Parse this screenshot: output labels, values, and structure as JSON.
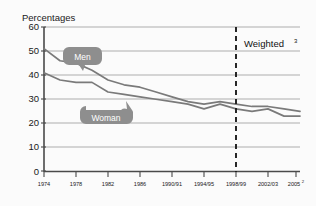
{
  "chart_data": {
    "type": "line",
    "title": "",
    "ylabel": "Percentages",
    "xlabel": "",
    "ylim": [
      0,
      60
    ],
    "ytick_values": [
      0,
      10,
      20,
      30,
      40,
      50,
      60
    ],
    "ytick_labels": [
      "0",
      "10",
      "20",
      "30",
      "40",
      "50",
      "60"
    ],
    "grid": true,
    "legend_position": "inline-callouts",
    "categories": [
      "1974",
      "1976",
      "1978",
      "1980",
      "1982",
      "1984",
      "1986",
      "1988",
      "1990/91",
      "1992/93",
      "1994/95",
      "1996/97",
      "1998/99",
      "2000/01",
      "2002/03",
      "2004/05",
      "2005"
    ],
    "xtick_labels": [
      "1974",
      "1978",
      "1982",
      "1986",
      "1990/91",
      "1994/95",
      "1998/99",
      "2002/03",
      "2005"
    ],
    "xtick_superscripts": [
      "",
      "",
      "",
      "",
      "",
      "",
      "",
      "",
      "2"
    ],
    "series": [
      {
        "name": "Men",
        "color": "#7a7a7a",
        "values": [
          51,
          46,
          45,
          42,
          38,
          36,
          35,
          33,
          31,
          29,
          28,
          29,
          28,
          27,
          27,
          26,
          25
        ]
      },
      {
        "name": "Woman",
        "color": "#7a7a7a",
        "values": [
          41,
          38,
          37,
          37,
          33,
          32,
          31,
          30,
          29,
          28,
          26,
          28,
          26,
          25,
          26,
          23,
          23
        ]
      }
    ],
    "annotations": [
      {
        "name": "weighted-divider",
        "label": "Weighted",
        "superscript": "3",
        "at_category": "1998/99",
        "style": "vertical-dashed-line"
      }
    ],
    "callouts": [
      {
        "name": "men-callout",
        "label": "Men",
        "points_to": "Men"
      },
      {
        "name": "woman-callout",
        "label": "Woman",
        "points_to": "Woman"
      }
    ]
  }
}
